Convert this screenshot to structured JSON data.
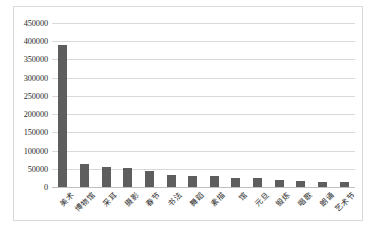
{
  "chart_data": {
    "type": "bar",
    "title": "",
    "xlabel": "",
    "ylabel": "",
    "ylim": [
      0,
      450000
    ],
    "y_ticks": [
      0,
      50000,
      100000,
      150000,
      200000,
      250000,
      300000,
      350000,
      400000,
      450000
    ],
    "y_tick_labels": [
      "0",
      "50000",
      "100000",
      "150000",
      "200000",
      "250000",
      "300000",
      "350000",
      "400000",
      "450000"
    ],
    "grid": true,
    "legend": false,
    "bar_color": "#5e5e5e",
    "grid_color": "#d9d9d9",
    "categories": [
      "美术",
      "博物馆",
      "采耳",
      "摄影",
      "春节",
      "书法",
      "舞蹈",
      "素描",
      "馆",
      "元旦",
      "锻炼",
      "唱歌",
      "朗诵",
      "艺术节"
    ],
    "values": [
      390000,
      62000,
      54000,
      52000,
      45000,
      33000,
      31000,
      29000,
      26000,
      25000,
      19000,
      17000,
      15000,
      14000
    ]
  }
}
